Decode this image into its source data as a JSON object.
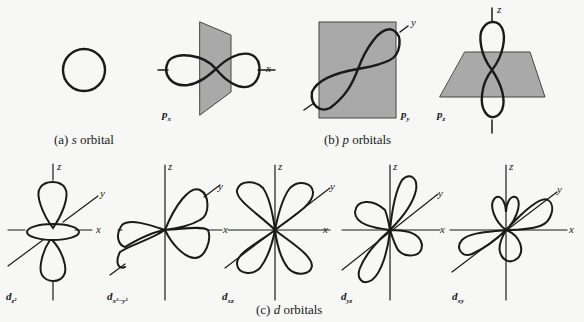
{
  "colors": {
    "stroke": "#1a1a1a",
    "plane": "#a9a9a9",
    "background": "#f7f7f5"
  },
  "captions": {
    "a": {
      "prefix": "(a)",
      "letter": "s",
      "rest": " orbital"
    },
    "b": {
      "prefix": "(b)",
      "letter": "p",
      "rest": " orbitals"
    },
    "c": {
      "prefix": "(c)",
      "letter": "d",
      "rest": " orbitals"
    }
  },
  "labels": {
    "px": {
      "base": "p",
      "sub": "x"
    },
    "py": {
      "base": "p",
      "sub": "y"
    },
    "pz": {
      "base": "p",
      "sub": "z"
    },
    "dz2": {
      "base": "d",
      "sub": "z²"
    },
    "dx2y2": {
      "base": "d",
      "sub": "x²−y²"
    },
    "dxz": {
      "base": "d",
      "sub": "xz"
    },
    "dyz": {
      "base": "d",
      "sub": "yz"
    },
    "dxy": {
      "base": "d",
      "sub": "xy"
    }
  },
  "axes": {
    "x": "x",
    "y": "y",
    "z": "z"
  }
}
